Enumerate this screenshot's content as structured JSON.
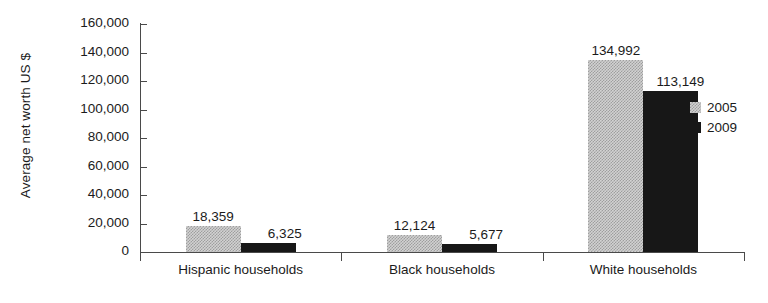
{
  "chart_data": {
    "type": "bar",
    "title": "",
    "xlabel": "",
    "ylabel": "Average net worth US $",
    "ylim": [
      0,
      160000
    ],
    "grid": false,
    "legend_position": "right",
    "categories": [
      "Hispanic households",
      "Black households",
      "White households"
    ],
    "series": [
      {
        "name": "2005",
        "color": "#d2d2d2",
        "values": [
          18359,
          12124,
          134992
        ],
        "value_labels": [
          "18,359",
          "12,124",
          "134,992"
        ]
      },
      {
        "name": "2009",
        "color": "#171717",
        "values": [
          6325,
          5677,
          113149
        ],
        "value_labels": [
          "6,325",
          "5,677",
          "113,149"
        ]
      }
    ],
    "ytick_labels": [
      "160,000",
      "140,000",
      "120,000",
      "100,000",
      "80,000",
      "60,000",
      "40,000",
      "20,000",
      "0"
    ],
    "ytick_values": [
      160000,
      140000,
      120000,
      100000,
      80000,
      60000,
      40000,
      20000,
      0
    ]
  },
  "legend": {
    "items": [
      {
        "label": "2005",
        "swatch": "light-dithered-swatch"
      },
      {
        "label": "2009",
        "swatch": "dark-solid-swatch"
      }
    ]
  }
}
